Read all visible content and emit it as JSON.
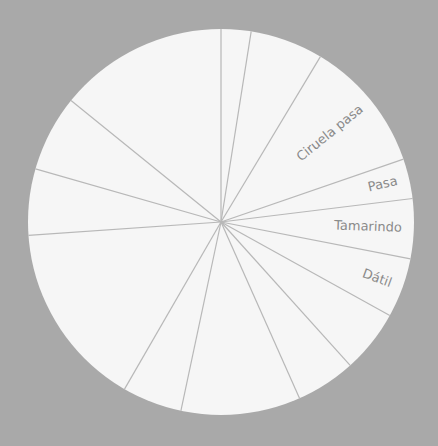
{
  "chart_data": {
    "type": "pie",
    "title": "",
    "start_angle_deg": 0,
    "direction": "clockwise",
    "center": [
      221,
      222
    ],
    "radius": 193,
    "colors": {
      "background": "#a9a9a9",
      "slice_fill": "#f6f6f6",
      "divider": "#b8b8b8",
      "label": "#8a8a8a"
    },
    "slices": [
      {
        "label": "",
        "value": 9
      },
      {
        "label": "",
        "value": 22
      },
      {
        "label": "Ciruela pasa",
        "value": 40
      },
      {
        "label": "Pasa",
        "value": 12
      },
      {
        "label": "Tamarindo",
        "value": 18
      },
      {
        "label": "Dátil",
        "value": 18
      },
      {
        "label": "",
        "value": 19
      },
      {
        "label": "",
        "value": 18
      },
      {
        "label": "",
        "value": 36
      },
      {
        "label": "",
        "value": 18
      },
      {
        "label": "",
        "value": 56
      },
      {
        "label": "",
        "value": 20
      },
      {
        "label": "",
        "value": 23
      },
      {
        "label": "",
        "value": 51
      }
    ],
    "legend": "none",
    "labels_visible": [
      "Ciruela pasa",
      "Pasa",
      "Tamarindo",
      "Dátil"
    ]
  }
}
